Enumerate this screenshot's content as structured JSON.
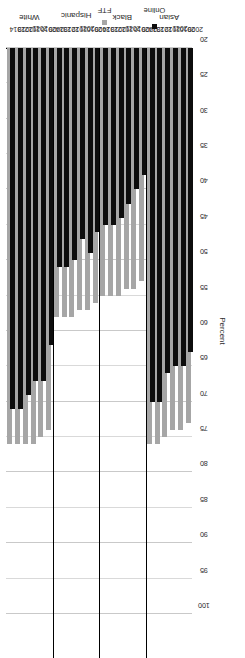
{
  "chart_data": {
    "type": "bar",
    "title": "",
    "xlabel": "",
    "ylabel": "Percent",
    "ylim": [
      20,
      100
    ],
    "y_ticks": [
      100,
      95,
      90,
      85,
      80,
      75,
      70,
      65,
      60,
      55,
      50,
      45,
      40,
      35,
      30,
      25,
      20
    ],
    "grid": true,
    "orientation": "rotated-90-ccw",
    "legend_position": "right",
    "legend": [
      "Online",
      "FTF"
    ],
    "series_colors": {
      "Online": "#0d0d0d",
      "FTF": "#a6a6a6"
    },
    "categories": [
      "2009",
      "2010",
      "2011",
      "2012",
      "2013",
      "2014"
    ],
    "groups": [
      {
        "name": "White",
        "categories": [
          "2009",
          "2010",
          "2011",
          "2012",
          "2013",
          "2014"
        ],
        "series": [
          {
            "name": "Online",
            "values": [
              62,
              67,
              67,
              69,
              71,
              71
            ]
          },
          {
            "name": "FTF",
            "values": [
              74,
              75,
              76,
              76,
              76,
              76
            ]
          }
        ]
      },
      {
        "name": "Hispanic",
        "categories": [
          "2009",
          "2010",
          "2011",
          "2012",
          "2013",
          "2014"
        ],
        "series": [
          {
            "name": "Online",
            "values": [
              46,
              49,
              47,
              50,
              51,
              51
            ]
          },
          {
            "name": "FTF",
            "values": [
              56,
              57,
              57,
              58,
              58,
              58
            ]
          }
        ]
      },
      {
        "name": "Black",
        "categories": [
          "2009",
          "2010",
          "2011",
          "2012",
          "2013",
          "2014"
        ],
        "series": [
          {
            "name": "Online",
            "values": [
              38,
              40,
              42,
              44,
              45,
              45
            ]
          },
          {
            "name": "FTF",
            "values": [
              53,
              54,
              54,
              55,
              55,
              55
            ]
          }
        ]
      },
      {
        "name": "Asian",
        "categories": [
          "2009",
          "2010",
          "2011",
          "2012",
          "2013",
          "2014"
        ],
        "series": [
          {
            "name": "Online",
            "values": [
              63,
              65,
              65,
              66,
              70,
              70
            ]
          },
          {
            "name": "FTF",
            "values": [
              73,
              74,
              74,
              75,
              76,
              76
            ]
          }
        ]
      }
    ]
  },
  "axis": {
    "value_axis_title": "Percent"
  },
  "legend": {
    "items": [
      {
        "label": "Online",
        "color": "#0d0d0d"
      },
      {
        "label": "FTF",
        "color": "#a6a6a6"
      }
    ]
  }
}
